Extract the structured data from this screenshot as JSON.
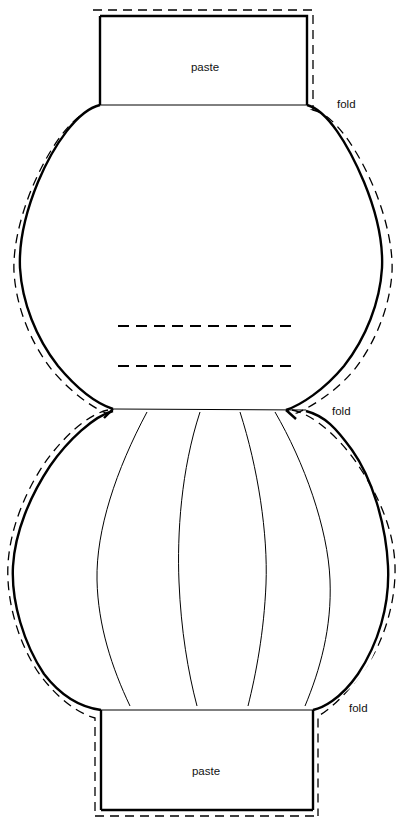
{
  "document": {
    "title": "Paper Lantern Cut-Out Template",
    "kind": "craft-pattern-diagram",
    "canvas": {
      "width": 403,
      "height": 827
    },
    "background_color": "#ffffff",
    "line_color": "#000000"
  },
  "labels": {
    "paste_top": "paste",
    "fold_top": "fold",
    "fold_middle": "fold",
    "fold_bottom": "fold",
    "paste_bottom": "paste"
  },
  "parts": {
    "top_tab": {
      "name": "paste",
      "label": "paste",
      "shape": "rectangle",
      "x": 100,
      "y": 16,
      "width": 207,
      "height": 89,
      "label_x": 205,
      "label_y": 71
    },
    "top_balloon": {
      "name": "upper-lantern-body",
      "shape": "rounded-bulb",
      "top_y": 105,
      "bottom_y": 410,
      "left_x": 19,
      "right_x": 381,
      "waist_left_x": 113,
      "waist_right_x": 286
    },
    "bottom_balloon": {
      "name": "lower-lantern-body",
      "shape": "rounded-bulb-with-ribs",
      "top_y": 411,
      "bottom_y": 710,
      "left_x": 13,
      "right_x": 388,
      "waist_left_x": 113,
      "waist_right_x": 306,
      "rib_count": 4
    },
    "bottom_tab": {
      "name": "paste",
      "label": "paste",
      "shape": "rectangle",
      "x": 101,
      "y": 709,
      "width": 212,
      "height": 101,
      "label_x": 206,
      "label_y": 775
    }
  },
  "fold_labels": [
    {
      "text": "fold",
      "x": 337,
      "y": 108
    },
    {
      "text": "fold",
      "x": 332,
      "y": 415
    },
    {
      "text": "fold",
      "x": 349,
      "y": 712
    }
  ],
  "crease_lines": [
    {
      "name": "upper-crease-1",
      "x1": 118,
      "y1": 326,
      "x2": 298,
      "y2": 326
    },
    {
      "name": "upper-crease-2",
      "x1": 118,
      "y1": 366,
      "x2": 294,
      "y2": 366
    }
  ],
  "legend": {
    "solid_line_meaning": "cut line",
    "dashed_line_meaning": "fold line"
  }
}
